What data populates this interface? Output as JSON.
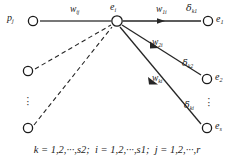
{
  "figure": {
    "type": "node-link-diagram",
    "background_color": "#ffffff",
    "line_color": "#262626",
    "node_stroke_color": "#1a1a1a",
    "node_fill_color": "#ffffff"
  },
  "nodes": {
    "input_main": {
      "label_base": "p",
      "label_sub": "j",
      "cx": 33,
      "cy": 21
    },
    "hub": {
      "label_base": "e",
      "label_sub": "i",
      "cx": 117,
      "cy": 21
    },
    "input_mid": {
      "label_base": "",
      "label_sub": "",
      "cx": 28,
      "cy": 71
    },
    "input_low": {
      "label_base": "",
      "label_sub": "",
      "cx": 28,
      "cy": 128
    },
    "output_1": {
      "label_base": "e",
      "label_sub": "1",
      "cx": 208,
      "cy": 21
    },
    "output_2": {
      "label_base": "e",
      "label_sub": "2",
      "cx": 207,
      "cy": 79
    },
    "output_s": {
      "label_base": "e",
      "label_sub": "s",
      "cx": 207,
      "cy": 128
    }
  },
  "edge_labels": {
    "w_ij": {
      "base": "w",
      "sub": "ij",
      "x": 70,
      "y": 5
    },
    "w_1i": {
      "base": "w",
      "sub": "1i",
      "x": 156,
      "y": 5
    },
    "w_2i": {
      "base": "w",
      "sub": "2i",
      "x": 152,
      "y": 38
    },
    "w_ki": {
      "base": "w",
      "sub": "ki",
      "x": 152,
      "y": 74
    },
    "delta_k1": {
      "base": "δ",
      "sub": "k1",
      "x": 186,
      "y": 3
    },
    "delta_k2": {
      "base": "δ",
      "sub": "k2",
      "x": 182,
      "y": 58
    },
    "delta_ki": {
      "base": "δ",
      "sub": "ki",
      "x": 184,
      "y": 100
    }
  },
  "ellipses": {
    "left_vertical": {
      "x": 26,
      "y": 96,
      "glyph": "·"
    },
    "right_vertical": {
      "x": 207,
      "y": 97,
      "glyph": "·"
    }
  },
  "caption": {
    "k_range": "k = 1,2,···,s2;",
    "i_range": "i = 1,2,···,s1;",
    "j_range": "j = 1,2,···,r",
    "full_text": "k = 1,2,···,s2;  i = 1,2,···,s1;  j = 1,2,···,r"
  }
}
